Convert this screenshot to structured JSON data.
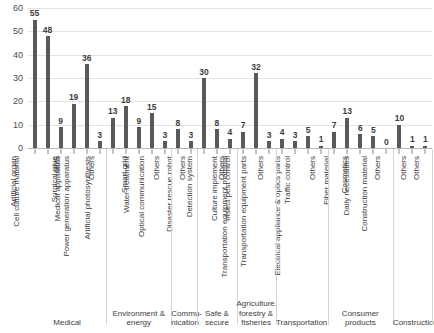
{
  "chart_data": {
    "type": "bar",
    "title": "",
    "xlabel": "",
    "ylabel": "",
    "ylim": [
      0,
      60
    ],
    "ytick_step": 10,
    "yticks": [
      60,
      50,
      40,
      30,
      20,
      10,
      0
    ],
    "grid": true,
    "legend": "none",
    "bar_color": "#595959",
    "gridline_color": "#e2e2e2",
    "categories": [
      "Artificial organ",
      "Cell culture material",
      "DDS",
      "Surgical glue",
      "Medical apparatus",
      "Others",
      "Power generation apparatus",
      "Artificial photosynthesis",
      "Smart grid",
      "Water treatment",
      "Others",
      "Optical communication",
      "Others",
      "Disaster rescue robot",
      "Detection system",
      "Others",
      "Culture implement",
      "Insect pest control",
      "Others",
      "Transportation equipment material",
      "Transportation equipment parts",
      "Traffic control",
      "Others",
      "Electrical appliance & optics parts",
      "Fiber material",
      "Cosmetics",
      "Daily necessities",
      "Others",
      "Construction material",
      "Others",
      "Others"
    ],
    "values": [
      55,
      48,
      9,
      19,
      36,
      3,
      13,
      18,
      9,
      15,
      3,
      8,
      3,
      30,
      8,
      4,
      7,
      32,
      3,
      4,
      3,
      5,
      1,
      7,
      13,
      6,
      5,
      0,
      10,
      1,
      1
    ],
    "groups": [
      {
        "label": "Medical",
        "count": 6
      },
      {
        "label": "Environment & energy",
        "count": 5
      },
      {
        "label": "Commu-\nnication",
        "count": 2
      },
      {
        "label": "Safe & secure",
        "count": 3
      },
      {
        "label": "Agriculture, forestry & fisheries",
        "count": 3
      },
      {
        "label": "Transportation",
        "count": 4
      },
      {
        "label": "Consumer products",
        "count": 5
      },
      {
        "label": "Construction",
        "count": 3
      }
    ]
  }
}
